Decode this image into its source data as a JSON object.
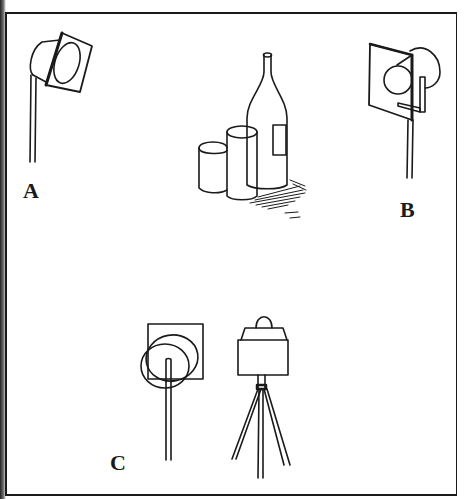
{
  "figure": {
    "labels": {
      "a": "A",
      "b": "B",
      "c": "C"
    },
    "subjects": [
      "spotlight-a",
      "still-life",
      "spotlight-b",
      "floodlight-c",
      "camera-on-tripod"
    ],
    "colors": {
      "ink": "#1a1a1a",
      "paper": "#ffffff"
    }
  }
}
